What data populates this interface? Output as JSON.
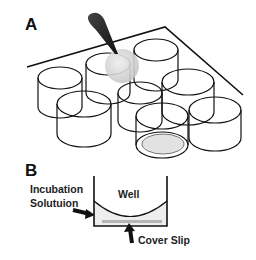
{
  "panel_a": {
    "label": "A",
    "description": "Multi-well plate with cylindrical wells, a pipette dispensing a droplet, and one well containing a cover slip"
  },
  "panel_b": {
    "label": "B",
    "well_label": "Well",
    "incubation_label_line1": "Incubation",
    "incubation_label_line2": "Solutuion",
    "cover_slip_label": "Cover Slip"
  },
  "colors": {
    "line": "#111111",
    "droplet": "#d8d8d8",
    "solution": "#ececec",
    "cover_slip": "#b5b5b5"
  }
}
